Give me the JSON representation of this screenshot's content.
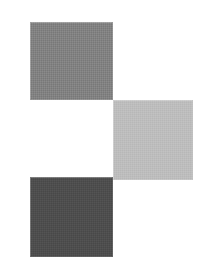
{
  "image": {
    "title": "Three gray squares in staircase arrangement",
    "width": 211,
    "height": 275,
    "background_color": "#ffffff"
  },
  "chart_data": {
    "type": "scatter",
    "xlabel": "",
    "ylabel": "",
    "xlim": [
      0,
      211
    ],
    "ylim": [
      0,
      275
    ],
    "grid": false,
    "legend": "none",
    "categories": [
      "top-square",
      "middle-square",
      "bottom-square"
    ],
    "values": [
      128,
      188,
      77
    ],
    "series": [
      {
        "name": "gray level (0-255)",
        "values": [
          128,
          188,
          77
        ]
      }
    ],
    "annotations": [
      "Squares touch only at their corners, forming a zigzag staircase",
      "Top and bottom squares share the same left edge",
      "Middle square is offset to the right and vertically between the others"
    ]
  },
  "shapes": [
    {
      "id": "top-square",
      "label": "Top square",
      "tone": "medium gray",
      "color": "#808080",
      "x": 30,
      "y": 22,
      "width": 83,
      "height": 78
    },
    {
      "id": "middle-square",
      "label": "Middle square",
      "tone": "light gray",
      "color": "#bcbcbc",
      "x": 113,
      "y": 100,
      "width": 80,
      "height": 80
    },
    {
      "id": "bottom-square",
      "label": "Bottom square",
      "tone": "dark gray",
      "color": "#4d4d4d",
      "x": 30,
      "y": 177,
      "width": 83,
      "height": 80
    }
  ]
}
